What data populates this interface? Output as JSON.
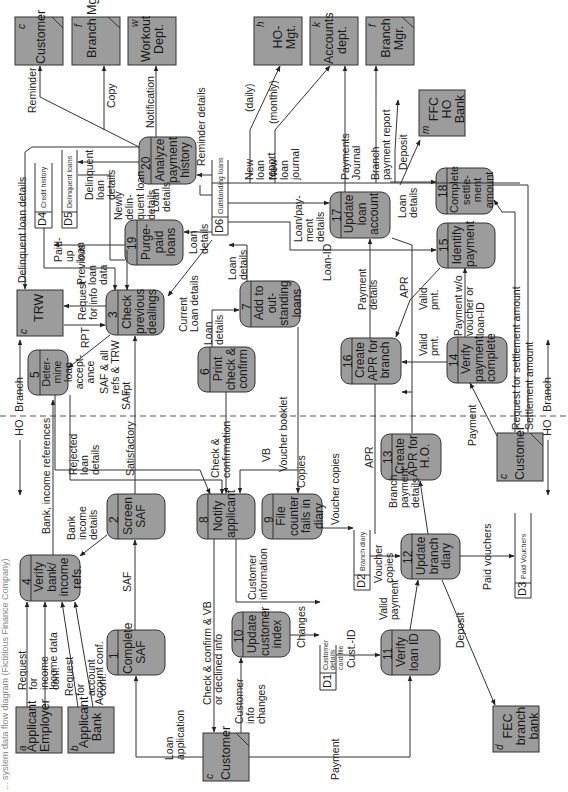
{
  "diagram": {
    "type": "data-flow-diagram",
    "orientation": "rotated-90-clockwise",
    "caption_partial": "... system data flow diagram (Fictitious Finance Company)",
    "boundary": {
      "left_label": "Branch",
      "right_label": "HO",
      "style": "dashed"
    },
    "colors": {
      "process_fill": "#9c9c9c",
      "entity_fill": "#9c9c9c",
      "line": "#333333",
      "background": "#ffffff"
    }
  },
  "external_entities": [
    {
      "id": "c",
      "name": "Customer",
      "position": "top-left",
      "duplicate_mark": true
    },
    {
      "id": "f",
      "name": "Branch Mgr.",
      "position": "top",
      "duplicate_mark": true
    },
    {
      "id": "w",
      "name": "Workout Dept.",
      "position": "top"
    },
    {
      "id": "h",
      "name": "HO-Mgt.",
      "position": "top"
    },
    {
      "id": "k",
      "name": "Accounts dept.",
      "position": "top"
    },
    {
      "id": "f",
      "name": "Branch Mgr.",
      "position": "top-right",
      "duplicate_mark": true
    },
    {
      "id": "m",
      "name": "FFC HO Bank",
      "position": "right"
    },
    {
      "id": "c",
      "name": "TRW",
      "position": "left"
    },
    {
      "id": "a",
      "name": "Applicant Employer",
      "position": "bottom-left"
    },
    {
      "id": "b",
      "name": "Applicant Bank",
      "position": "bottom-left"
    },
    {
      "id": "c",
      "name": "Customer",
      "position": "bottom",
      "duplicate_mark": true
    },
    {
      "id": "c",
      "name": "Customer",
      "position": "right-middle",
      "duplicate_mark": true
    },
    {
      "id": "d",
      "name": "FEC branch bank",
      "position": "bottom-right"
    }
  ],
  "processes": [
    {
      "num": "1",
      "name": "Complete SAF"
    },
    {
      "num": "2",
      "name": "Screen SAF"
    },
    {
      "num": "3",
      "name": "Check previous dealings"
    },
    {
      "num": "4",
      "name": "Verify bank/ income refs."
    },
    {
      "num": "5",
      "name": "Deter- mine loan accept- ance"
    },
    {
      "num": "6",
      "name": "Print check & confirm"
    },
    {
      "num": "7",
      "name": "Add to out- standing loans"
    },
    {
      "num": "8",
      "name": "Notify applicant"
    },
    {
      "num": "9",
      "name": "File counter fails in diary"
    },
    {
      "num": "10",
      "name": "Update customer index"
    },
    {
      "num": "11",
      "name": "Verify loan ID"
    },
    {
      "num": "12",
      "name": "Update branch diary"
    },
    {
      "num": "13",
      "name": "Create APR for H.O."
    },
    {
      "num": "14",
      "name": "Verify payment complete"
    },
    {
      "num": "15",
      "name": "Identify payment"
    },
    {
      "num": "16",
      "name": "Create APR for branch"
    },
    {
      "num": "17",
      "name": "Update loan account"
    },
    {
      "num": "18",
      "name": "Complete settle- ment amount"
    },
    {
      "num": "19",
      "name": "Purge- paid loans"
    },
    {
      "num": "20",
      "name": "Analyze payment history"
    }
  ],
  "data_stores": [
    {
      "id": "D1",
      "name": "Customer details card file"
    },
    {
      "id": "D2",
      "name": "Branch diary"
    },
    {
      "id": "D3",
      "name": "Paid Vouchers"
    },
    {
      "id": "D4",
      "name": "Credit history"
    },
    {
      "id": "D5",
      "name": "Delinquent loans"
    },
    {
      "id": "D6",
      "name": "Outstanding loans"
    }
  ],
  "flows": {
    "reminder": "Reminder",
    "copy": "Copy",
    "notification": "Notification",
    "delinquent_loan_details_top": "Delinquent loan details",
    "delinquent_loan_details": "Delinquent loan details",
    "newly_delinquent": "Newly delin- quent loan details",
    "loan_details_20": "Loan details",
    "reminder_details": "Reminder details",
    "new_loan_report": "New loan report",
    "daily": "(daily)",
    "new_loan_journal": "New loan journal",
    "monthly": "(monthly)",
    "payments_journal": "Payments Journal",
    "branch_payment_report": "Branch payment report",
    "deposit_top": "Deposit",
    "loan_details_18": "Loan details",
    "loan_payment_details": "Loan/pay- ment details",
    "loan_id": "Loan-ID",
    "apr": "APR",
    "payment_details": "Payment details",
    "valid_pmt_1": "Valid pmt.",
    "valid_pmt_2": "Valid pmt.",
    "payment_wo_voucher": "Payment w/o voucher or loan-ID",
    "request_settlement": "Request for settlement amount",
    "settlement_amount": "Settlement amount",
    "paid_up_loan": "Paid- up loan",
    "previous_loan_data": "Previous loan data",
    "request_for_info": "Request for info",
    "rpt": "RPT",
    "loan_details_19": "Loan details",
    "current_loan_details": "Current Loan details",
    "loan_details_7": "Loan details",
    "loan_details_6": "Loan details",
    "saf_refs_trw": "SAF & all refs & TRW rpt",
    "saf_3": "SAF",
    "satisfactory": "Satisfactory",
    "rejected_loan_details": "Rejected loan details",
    "bank_income_refs": "Bank, income references",
    "bank_income_details": "Bank income details",
    "saf_2": "SAF",
    "check_confirmation": "Check & confirmation",
    "vb": "VB",
    "voucher_booklet": "Voucher booklet",
    "copies": "Copies",
    "apr_13": "APR",
    "payment_14": "Payment",
    "request_income_conf": "Request for income conf.",
    "income_data": "Income data",
    "request_account_conf": "Request for account conf.",
    "account_conf": "Account conf.",
    "loan_application": "Loan application",
    "check_confirm_vb": "Check & confirm & VB or declined info",
    "customer_information": "Customer information",
    "customer_info_changes": "Customer info changes",
    "changes": "Changes",
    "voucher_copies_d2": "Voucher copies",
    "voucher_copies_12": "Voucher copies",
    "branch_payment_details": "Branch payment details",
    "cust_id": "Cust.-ID",
    "valid_payment": "Valid payment",
    "deposit_12": "Deposit",
    "paid_vouchers": "Paid vouchers",
    "payment_bottom": "Payment"
  },
  "labels": {
    "branch": "Branch",
    "ho": "HO"
  }
}
